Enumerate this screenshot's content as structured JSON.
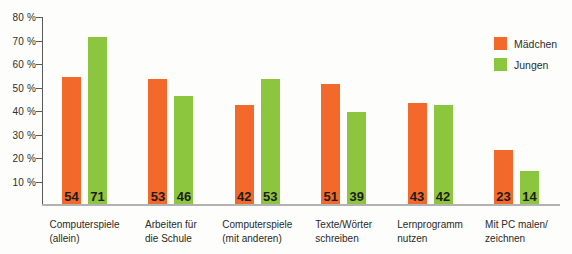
{
  "chart_data": {
    "type": "bar",
    "categories": [
      [
        "Computerspiele",
        "(allein)"
      ],
      [
        "Arbeiten für",
        "die Schule"
      ],
      [
        "Computerspiele",
        "(mit anderen)"
      ],
      [
        "Texte/Wörter",
        "schreiben"
      ],
      [
        "Lernprogramm",
        "nutzen"
      ],
      [
        "Mit PC malen/",
        "zeichnen"
      ]
    ],
    "series": [
      {
        "name": "Mädchen",
        "color": "#f2692b",
        "values": [
          54,
          53,
          42,
          51,
          43,
          23
        ]
      },
      {
        "name": "Jungen",
        "color": "#8cc63f",
        "values": [
          71,
          46,
          53,
          39,
          42,
          14
        ]
      }
    ],
    "title": "",
    "xlabel": "",
    "ylabel": "",
    "ylim": [
      0,
      80
    ],
    "yticks": [
      10,
      20,
      30,
      40,
      50,
      60,
      70,
      80
    ],
    "ytick_labels": [
      "10 %",
      "20 %",
      "30 %",
      "40 %",
      "50 %",
      "60 %",
      "70 %",
      "80 %"
    ],
    "grid": false,
    "legend_position": "top-right",
    "value_labels_inside_bars_bottom": true,
    "colors": {
      "value_text": "#1f1c18",
      "axis": "#5a5a5a",
      "baseline": "#b2b2b0",
      "background": "#fdfdfb"
    }
  },
  "legend": {
    "items": [
      {
        "label": "Mädchen",
        "color": "#f2692b"
      },
      {
        "label": "Jungen",
        "color": "#8cc63f"
      }
    ]
  }
}
